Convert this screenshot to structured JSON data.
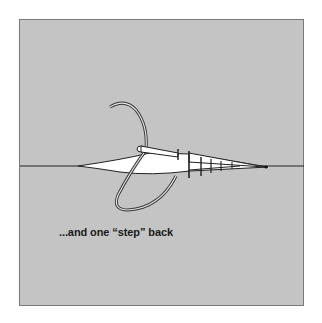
{
  "illustration": {
    "subject": "needle-and-thread-stitch-diagram",
    "caption": "...and one “step” back",
    "colors": {
      "background": "#ffffff",
      "panel": "#c4c4c4",
      "panel_border": "#7a7a7a",
      "fabric_line": "#222222",
      "slit_fill": "#ffffff",
      "thread_stroke": "#333333",
      "caption_text": "#1a1a1a"
    }
  }
}
